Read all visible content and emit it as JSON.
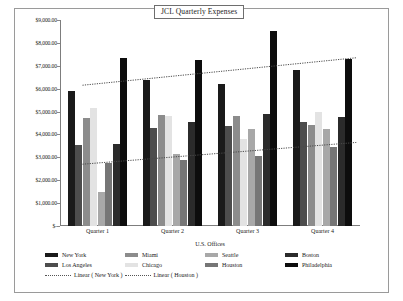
{
  "chart_data": {
    "type": "bar",
    "title": "JCL Quarterly Expenses",
    "xlabel": "U.S. Offices",
    "ylabel": "Expenses",
    "categories": [
      "Quarter 1",
      "Quarter 2",
      "Quarter 3",
      "Quarter 4"
    ],
    "ylim": [
      0,
      9000
    ],
    "ytick_values": [
      0,
      1000,
      2000,
      3000,
      4000,
      5000,
      6000,
      7000,
      8000,
      9000
    ],
    "ytick_labels": [
      "$-",
      "$1,000.00",
      "$2,000.00",
      "$3,000.00",
      "$4,000.00",
      "$5,000.00",
      "$6,000.00",
      "$7,000.00",
      "$8,000.00",
      "$9,000.00"
    ],
    "grid": false,
    "legend_position": "bottom",
    "series": [
      {
        "name": "New York",
        "color": "#1a1a1a",
        "values": [
          5900,
          6400,
          6200,
          6800
        ]
      },
      {
        "name": "Los Angeles",
        "color": "#4d4d4d",
        "values": [
          3550,
          4300,
          4350,
          4550
        ]
      },
      {
        "name": "Miami",
        "color": "#8c8c8c",
        "values": [
          4700,
          4850,
          4800,
          4400
        ]
      },
      {
        "name": "Chicago",
        "color": "#e3e3e3",
        "values": [
          5150,
          4800,
          3800,
          5000
        ]
      },
      {
        "name": "Seattle",
        "color": "#a8a8a8",
        "values": [
          1500,
          3150,
          4250,
          4250
        ]
      },
      {
        "name": "Houston",
        "color": "#767676",
        "values": [
          2750,
          2900,
          3050,
          3450
        ]
      },
      {
        "name": "Boston",
        "color": "#2b2b2b",
        "values": [
          3600,
          4550,
          4900,
          4750
        ]
      },
      {
        "name": "Philadelphia",
        "color": "#0d0d0d",
        "values": [
          7350,
          7250,
          8500,
          7300
        ]
      }
    ],
    "trendlines": [
      {
        "name": "Linear ( New York )",
        "start": 6150,
        "end": 7350,
        "style": "dotted"
      },
      {
        "name": "Linear ( Houston )",
        "start": 2700,
        "end": 3650,
        "style": "dotted"
      }
    ]
  }
}
